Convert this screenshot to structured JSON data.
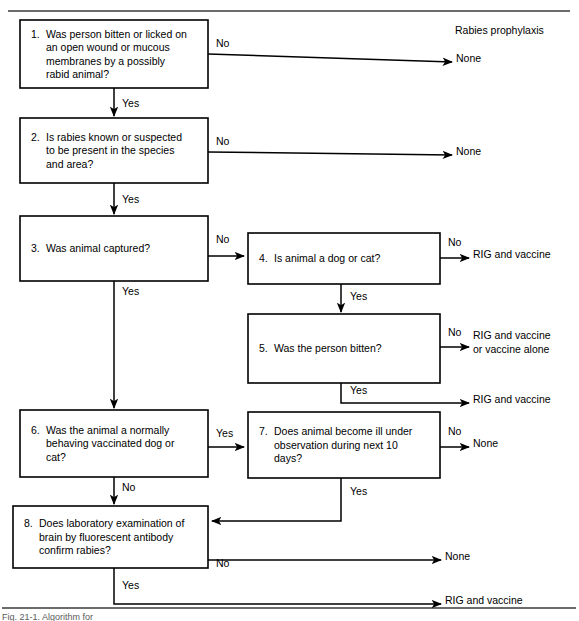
{
  "figure": {
    "header_label": "Rabies prophylaxis",
    "caption_partial": "Fig. 21-1. Algorithm for"
  },
  "boxes": [
    {
      "id": "box-1",
      "number": "1.",
      "lines": [
        "Was person bitten or licked on",
        "an open wound or mucous",
        "membranes by a possibly",
        "rabid animal?"
      ],
      "x": 20,
      "y": 20,
      "w": 188,
      "h": 68
    },
    {
      "id": "box-2",
      "number": "2.",
      "lines": [
        "Is rabies known or suspected",
        "to be present in the species",
        "and area?"
      ],
      "x": 20,
      "y": 118,
      "w": 188,
      "h": 65
    },
    {
      "id": "box-3",
      "number": "3.",
      "lines": [
        "Was animal captured?"
      ],
      "x": 20,
      "y": 216,
      "w": 188,
      "h": 65
    },
    {
      "id": "box-4",
      "number": "4.",
      "lines": [
        "Is animal a dog or cat?"
      ],
      "x": 248,
      "y": 233,
      "w": 192,
      "h": 51
    },
    {
      "id": "box-5",
      "number": "5.",
      "lines": [
        "Was the person bitten?"
      ],
      "x": 248,
      "y": 314,
      "w": 192,
      "h": 69
    },
    {
      "id": "box-6",
      "number": "6.",
      "lines": [
        "Was the animal a normally",
        "behaving vaccinated dog or",
        "cat?"
      ],
      "x": 20,
      "y": 410,
      "w": 188,
      "h": 67
    },
    {
      "id": "box-7",
      "number": "7.",
      "lines": [
        "Does animal become ill under",
        "observation during next 10",
        "days?"
      ],
      "x": 248,
      "y": 412,
      "w": 192,
      "h": 66
    },
    {
      "id": "box-8",
      "number": "8.",
      "lines": [
        "Does laboratory examination of",
        "brain by fluorescent antibody",
        "confirm rabies?"
      ],
      "x": 13,
      "y": 506,
      "w": 195,
      "h": 62
    }
  ],
  "edge_labels": [
    {
      "id": "edge-1-no",
      "text": "No",
      "x": 216,
      "y": 47
    },
    {
      "id": "edge-1-yes",
      "text": "Yes",
      "x": 122,
      "y": 107
    },
    {
      "id": "edge-2-no",
      "text": "No",
      "x": 216,
      "y": 145
    },
    {
      "id": "edge-2-yes",
      "text": "Yes",
      "x": 122,
      "y": 203
    },
    {
      "id": "edge-3-no",
      "text": "No",
      "x": 216,
      "y": 243
    },
    {
      "id": "edge-3-yes",
      "text": "Yes",
      "x": 122,
      "y": 295
    },
    {
      "id": "edge-4-no",
      "text": "No",
      "x": 448,
      "y": 246
    },
    {
      "id": "edge-4-yes",
      "text": "Yes",
      "x": 350,
      "y": 300
    },
    {
      "id": "edge-5-no",
      "text": "No",
      "x": 448,
      "y": 336
    },
    {
      "id": "edge-5-yes",
      "text": "Yes",
      "x": 350,
      "y": 394
    },
    {
      "id": "edge-6-yes",
      "text": "Yes",
      "x": 216,
      "y": 437
    },
    {
      "id": "edge-6-no",
      "text": "No",
      "x": 122,
      "y": 491
    },
    {
      "id": "edge-7-no",
      "text": "No",
      "x": 448,
      "y": 435
    },
    {
      "id": "edge-7-yes",
      "text": "Yes",
      "x": 350,
      "y": 495
    },
    {
      "id": "edge-8-no",
      "text": "No",
      "x": 216,
      "y": 567
    },
    {
      "id": "edge-8-yes",
      "text": "Yes",
      "x": 122,
      "y": 589
    }
  ],
  "outcomes": [
    {
      "id": "outcome-1",
      "lines": [
        "None"
      ],
      "x": 456,
      "y": 62
    },
    {
      "id": "outcome-2",
      "lines": [
        "None"
      ],
      "x": 456,
      "y": 155
    },
    {
      "id": "outcome-3",
      "lines": [
        "RIG and vaccine"
      ],
      "x": 473,
      "y": 258
    },
    {
      "id": "outcome-4",
      "lines": [
        "RIG and vaccine",
        "or vaccine alone"
      ],
      "x": 473,
      "y": 339
    },
    {
      "id": "outcome-5",
      "lines": [
        "RIG and vaccine"
      ],
      "x": 473,
      "y": 403
    },
    {
      "id": "outcome-6",
      "lines": [
        "None"
      ],
      "x": 473,
      "y": 447
    },
    {
      "id": "outcome-7",
      "lines": [
        "None"
      ],
      "x": 445,
      "y": 560
    },
    {
      "id": "outcome-8",
      "lines": [
        "RIG and vaccine"
      ],
      "x": 445,
      "y": 604
    }
  ],
  "colors": {
    "stroke": "#000000",
    "frame": "#3a3a3a",
    "background": "#ffffff"
  }
}
